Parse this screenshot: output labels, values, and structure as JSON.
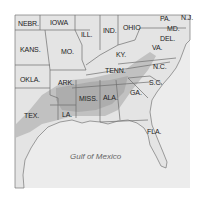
{
  "map": {
    "water_label": "Gulf of Mexico",
    "colors": {
      "background": "#ffffff",
      "land": "#e4e4e4",
      "water": "#ececec",
      "border": "#6f6f6f",
      "shaded_region": "#bdbdbd",
      "shaded_region_dark": "#a9a9a9"
    },
    "states": [
      {
        "id": "nebr",
        "label": "NEBR."
      },
      {
        "id": "iowa",
        "label": "IOWA"
      },
      {
        "id": "ill",
        "label": "ILL."
      },
      {
        "id": "ind",
        "label": "IND."
      },
      {
        "id": "ohio",
        "label": "OHIO"
      },
      {
        "id": "pa",
        "label": "PA."
      },
      {
        "id": "nj",
        "label": "N.J."
      },
      {
        "id": "md",
        "label": "MD."
      },
      {
        "id": "del",
        "label": "DEL."
      },
      {
        "id": "va",
        "label": "VA."
      },
      {
        "id": "kans",
        "label": "KANS."
      },
      {
        "id": "mo",
        "label": "MO."
      },
      {
        "id": "ky",
        "label": "KY."
      },
      {
        "id": "okla",
        "label": "OKLA."
      },
      {
        "id": "ark",
        "label": "ARK."
      },
      {
        "id": "tenn",
        "label": "TENN."
      },
      {
        "id": "nc",
        "label": "N.C."
      },
      {
        "id": "sc",
        "label": "S.C."
      },
      {
        "id": "tex",
        "label": "TEX."
      },
      {
        "id": "la",
        "label": "LA."
      },
      {
        "id": "miss",
        "label": "MISS."
      },
      {
        "id": "ala",
        "label": "ALA."
      },
      {
        "id": "ga",
        "label": "GA."
      },
      {
        "id": "fla",
        "label": "FLA."
      }
    ]
  }
}
